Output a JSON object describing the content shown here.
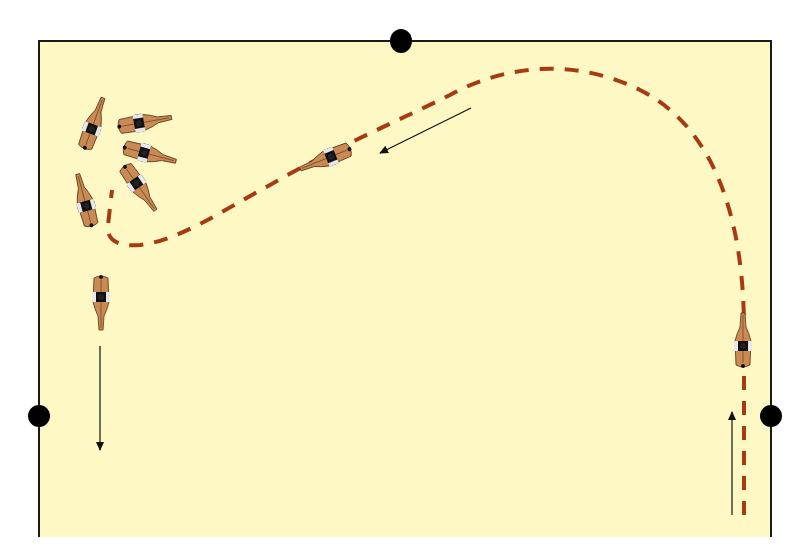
{
  "diagram": {
    "type": "arena-movement-diagram",
    "colors": {
      "background": "#ffffff",
      "arena_fill": "#fdf8c4",
      "arena_border": "#1a1a1a",
      "path": "#a83a12",
      "arrow": "#111111",
      "marker": "#000000",
      "horse_body": "#c98a55",
      "horse_outline": "#5a3417",
      "horse_saddle": "#111111",
      "horse_saddle_trim": "#e8e8e8"
    },
    "arena": {
      "left": 39,
      "top": 41,
      "right": 771,
      "bottom": 537,
      "open_bottom": true
    },
    "markers": [
      {
        "name": "marker-top-center",
        "x": 401,
        "y": 41,
        "rx": 11,
        "ry": 12
      },
      {
        "name": "marker-left",
        "x": 39,
        "y": 416,
        "rx": 11,
        "ry": 11
      },
      {
        "name": "marker-right",
        "x": 771,
        "y": 416,
        "rx": 11,
        "ry": 11
      }
    ],
    "path": {
      "description": "Dashed track: up the right long side, large loop across the top, diagonal back toward the left, then a tight turn near the left wall",
      "d": "M 744 515 L 744 330 C 744 230 720 130 640 90 C 580 60 510 62 450 95 C 400 120 330 150 270 185 C 220 212 180 240 140 245 C 118 247 106 240 108 225 L 112 190",
      "dash": "14 11",
      "width": 4
    },
    "arrows": [
      {
        "name": "arrow-up-right-side",
        "x1": 732,
        "y1": 515,
        "x2": 732,
        "y2": 412
      },
      {
        "name": "arrow-diagonal-left",
        "x1": 471,
        "y1": 108,
        "x2": 380,
        "y2": 153
      },
      {
        "name": "arrow-down-left-side",
        "x1": 100,
        "y1": 346,
        "x2": 100,
        "y2": 450
      }
    ],
    "horses": [
      {
        "name": "horse-right-side",
        "x": 743,
        "y": 345,
        "rotate": 180
      },
      {
        "name": "horse-diagonal",
        "x": 330,
        "y": 157,
        "rotate": 68
      },
      {
        "name": "horse-pirouette-1",
        "x": 92,
        "y": 128,
        "rotate": 200
      },
      {
        "name": "horse-pirouette-2",
        "x": 140,
        "y": 123,
        "rotate": 260
      },
      {
        "name": "horse-pirouette-3",
        "x": 145,
        "y": 153,
        "rotate": 285
      },
      {
        "name": "horse-pirouette-4",
        "x": 137,
        "y": 184,
        "rotate": 325
      },
      {
        "name": "horse-left-turn",
        "x": 86,
        "y": 205,
        "rotate": 165
      },
      {
        "name": "horse-left-exit",
        "x": 101,
        "y": 298,
        "rotate": 0
      }
    ]
  }
}
